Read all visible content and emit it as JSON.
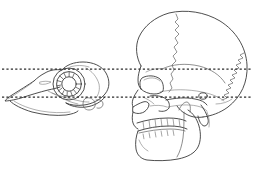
{
  "figure": {
    "title": "Comparative skull profiles with horizontal reference lines",
    "caption": "",
    "background_color": "#ffffff",
    "width": 253,
    "height": 170,
    "line_color": "#3a3a3a",
    "reference_line_color": "#2b2b2b"
  },
  "specimens": [
    {
      "id": "bird-skull",
      "label": "Bird skull, left lateral view",
      "position": "left",
      "orientation": "facing-left",
      "bounds": {
        "x": 4,
        "y": 64,
        "width": 106,
        "height": 58
      },
      "parts": [
        {
          "name": "upper-beak",
          "label": "Upper beak (rostrum maxillare)"
        },
        {
          "name": "lower-beak",
          "label": "Lower beak (mandible)"
        },
        {
          "name": "sclerotic-ring",
          "label": "Sclerotic ring",
          "ossicle_count": 13
        },
        {
          "name": "orbit",
          "label": "Orbit"
        },
        {
          "name": "braincase",
          "label": "Braincase (cranium)"
        },
        {
          "name": "occipital-condyle",
          "label": "Occipital condyle"
        },
        {
          "name": "quadrate",
          "label": "Quadrate"
        },
        {
          "name": "jugal-bar",
          "label": "Jugal bar"
        },
        {
          "name": "naris",
          "label": "Naris"
        }
      ]
    },
    {
      "id": "human-skull",
      "label": "Human skull, left lateral view",
      "position": "right",
      "orientation": "facing-left",
      "bounds": {
        "x": 116,
        "y": 12,
        "width": 134,
        "height": 150
      },
      "parts": [
        {
          "name": "frontal-bone",
          "label": "Frontal bone"
        },
        {
          "name": "parietal-bone",
          "label": "Parietal bone"
        },
        {
          "name": "occipital-bone",
          "label": "Occipital bone"
        },
        {
          "name": "temporal-bone",
          "label": "Temporal bone"
        },
        {
          "name": "coronal-suture",
          "label": "Coronal suture"
        },
        {
          "name": "lambdoid-suture",
          "label": "Lambdoid suture"
        },
        {
          "name": "squamosal-suture",
          "label": "Squamosal suture"
        },
        {
          "name": "orbit",
          "label": "Orbit"
        },
        {
          "name": "nasal-aperture",
          "label": "Nasal aperture"
        },
        {
          "name": "zygomatic-arch",
          "label": "Zygomatic arch"
        },
        {
          "name": "maxilla",
          "label": "Maxilla"
        },
        {
          "name": "mandible",
          "label": "Mandible"
        },
        {
          "name": "upper-teeth",
          "label": "Upper dentition",
          "tooth_count": 8
        },
        {
          "name": "lower-teeth",
          "label": "Lower dentition",
          "tooth_count": 7
        },
        {
          "name": "external-auditory-meatus",
          "label": "External auditory meatus"
        },
        {
          "name": "mastoid-process",
          "label": "Mastoid process"
        }
      ]
    }
  ],
  "reference_lines": [
    {
      "id": "upper-reference-line",
      "label": "Upper horizontal reference line",
      "y": 69,
      "x_start": 2,
      "x_end": 251
    },
    {
      "id": "lower-reference-line",
      "label": "Lower horizontal reference line",
      "y": 97,
      "x_start": 2,
      "x_end": 251
    }
  ]
}
